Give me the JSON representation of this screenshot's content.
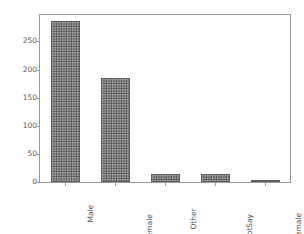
{
  "chart_data": {
    "type": "bar",
    "title": "",
    "xlabel": "",
    "ylabel": "",
    "categories": [
      "Male",
      "Female",
      "Other",
      "NotSay",
      "female"
    ],
    "values": [
      287,
      185,
      15,
      14,
      4
    ],
    "ylim": [
      0,
      297
    ],
    "yticks": [
      0,
      50,
      100,
      150,
      200,
      250
    ],
    "ytick_labels": [
      "0",
      "50",
      "100",
      "150",
      "200",
      "250"
    ],
    "xtick_rotation": 90,
    "grid": false,
    "legend": null,
    "bar_color": "#6b6b6b",
    "bar_edge_color": "#5c5c5c",
    "hatch": "dots",
    "spine_color": "#9a9a9a",
    "tick_label_color": "#555555",
    "background": "#ffffff"
  }
}
